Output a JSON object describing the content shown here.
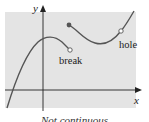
{
  "figure": {
    "background_color": "#e4e4e4",
    "curve_color": "#555555",
    "axis_color": "#222222",
    "axes": {
      "x_label": "x",
      "y_label": "y"
    },
    "annotations": {
      "break_label": "break",
      "hole_label": "hole"
    },
    "caption": "Not continuous"
  }
}
